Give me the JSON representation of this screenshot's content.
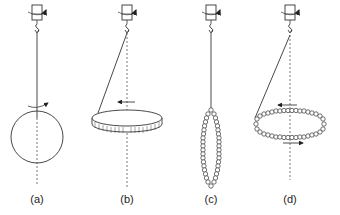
{
  "figure": {
    "panels": [
      {
        "id": "a",
        "label": "(a)",
        "object": "sphere",
        "axis_x": 37
      },
      {
        "id": "b",
        "label": "(b)",
        "object": "disk",
        "axis_x": 127
      },
      {
        "id": "c",
        "label": "(c)",
        "object": "vertical-chain-loop",
        "axis_x": 211
      },
      {
        "id": "d",
        "label": "(d)",
        "object": "horizontal-chain-loop",
        "axis_x": 290
      }
    ]
  },
  "colors": {
    "stroke": "#333333",
    "background": "#ffffff"
  }
}
